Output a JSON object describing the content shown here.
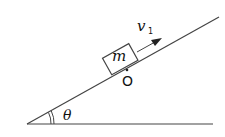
{
  "diagram": {
    "mass_label": "m",
    "velocity_label": "v",
    "velocity_subscript": "1",
    "point_label": "O",
    "angle_label": "θ",
    "colors": {
      "line": "#333333",
      "background": "#ffffff"
    }
  }
}
